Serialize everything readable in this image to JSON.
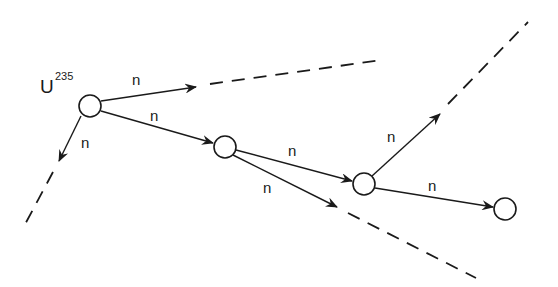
{
  "diagram": {
    "isotope": {
      "symbol": "U",
      "mass_number": "235"
    },
    "neutron_label": "n",
    "colors": {
      "stroke": "#1a1a1a",
      "background": "#ffffff"
    },
    "nuclei": [
      {
        "id": "nucleus-1",
        "cx": 90,
        "cy": 106,
        "r": 11
      },
      {
        "id": "nucleus-2",
        "cx": 225,
        "cy": 147,
        "r": 11
      },
      {
        "id": "nucleus-3",
        "cx": 364,
        "cy": 184,
        "r": 11
      },
      {
        "id": "nucleus-4",
        "cx": 505,
        "cy": 209,
        "r": 11
      }
    ],
    "neutrons": [
      {
        "id": "n1",
        "from": "nucleus-1",
        "label": "n",
        "x1": 101,
        "y1": 101,
        "x2": 196,
        "y2": 87,
        "label_x": 132,
        "label_y": 85,
        "continues_dashed": true,
        "dash": {
          "x1": 210,
          "y1": 84,
          "x2": 382,
          "y2": 60
        }
      },
      {
        "id": "n2",
        "from": "nucleus-1",
        "label": "n",
        "x1": 101,
        "y1": 111,
        "x2": 213,
        "y2": 143,
        "label_x": 150,
        "label_y": 121,
        "continues_dashed": false
      },
      {
        "id": "n3",
        "from": "nucleus-1",
        "label": "n",
        "x1": 81,
        "y1": 116,
        "x2": 59,
        "y2": 161,
        "label_x": 81,
        "label_y": 148,
        "continues_dashed": true,
        "dash": {
          "x1": 53,
          "y1": 172,
          "x2": 22,
          "y2": 230
        }
      },
      {
        "id": "n4",
        "from": "nucleus-2",
        "label": "n",
        "x1": 236,
        "y1": 150,
        "x2": 352,
        "y2": 181,
        "label_x": 288,
        "label_y": 156,
        "continues_dashed": false
      },
      {
        "id": "n5",
        "from": "nucleus-2",
        "label": "n",
        "x1": 233,
        "y1": 155,
        "x2": 337,
        "y2": 207,
        "label_x": 263,
        "label_y": 193,
        "continues_dashed": true,
        "dash": {
          "x1": 348,
          "y1": 213,
          "x2": 476,
          "y2": 278
        }
      },
      {
        "id": "n6",
        "from": "nucleus-3",
        "label": "n",
        "x1": 372,
        "y1": 176,
        "x2": 440,
        "y2": 114,
        "label_x": 387,
        "label_y": 142,
        "continues_dashed": true,
        "dash": {
          "x1": 448,
          "y1": 104,
          "x2": 528,
          "y2": 22
        }
      },
      {
        "id": "n7",
        "from": "nucleus-3",
        "label": "n",
        "x1": 375,
        "y1": 188,
        "x2": 493,
        "y2": 207,
        "label_x": 428,
        "label_y": 191,
        "continues_dashed": false
      }
    ]
  }
}
